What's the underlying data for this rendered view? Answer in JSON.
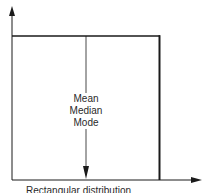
{
  "diagram": {
    "title": "Rectangular distribution",
    "center_labels": [
      "Mean",
      "Median",
      "Mode"
    ],
    "colors": {
      "line": "#1a1a1a",
      "text": "#2a2a2a",
      "background": "#ffffff"
    }
  }
}
